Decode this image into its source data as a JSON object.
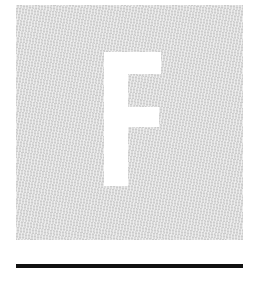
{
  "tile": {
    "letter": "F",
    "background_color": "#dadada",
    "letter_color": "#ffffff"
  },
  "rule": {
    "color": "#111111"
  }
}
